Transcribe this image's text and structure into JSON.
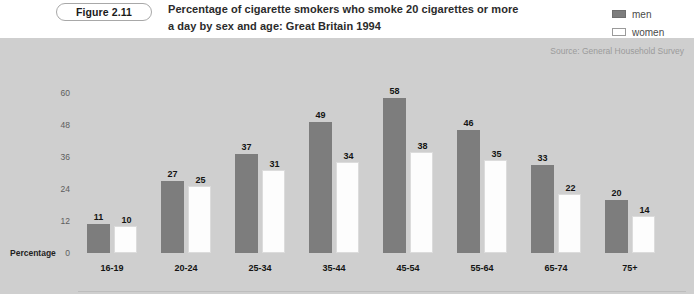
{
  "figure": {
    "badge_label": "Figure 2.11",
    "title_line_1": "Percentage of cigarette smokers who smoke 20 cigarettes or more",
    "title_line_2": "a day by sex and age: Great Britain 1994",
    "source": "Source: General Household Survey"
  },
  "legend": {
    "position": "top-right",
    "entries": [
      {
        "label": "men",
        "color": "#7d7d7d"
      },
      {
        "label": "women",
        "color": "#ffffff"
      }
    ]
  },
  "colors": {
    "panel_background": "#cfcfcf",
    "men_bar": "#7d7d7d",
    "women_bar": "#fdfdfd",
    "women_bar_border": "#dcdcdc",
    "page_background": "#ffffff",
    "source_text": "#9b9b9b"
  },
  "chart_data": {
    "type": "bar",
    "title": "Percentage of cigarette smokers who smoke 20 cigarettes or more a day by sex and age: Great Britain 1994",
    "subtitle": "",
    "xlabel": "Age",
    "ylabel": "Percentage",
    "categories": [
      "16-19",
      "20-24",
      "25-34",
      "35-44",
      "45-54",
      "55-64",
      "65-74",
      "75+"
    ],
    "series": [
      {
        "name": "men",
        "values": [
          11,
          27,
          37,
          49,
          58,
          46,
          33,
          20
        ]
      },
      {
        "name": "women",
        "values": [
          10,
          25,
          31,
          34,
          38,
          35,
          22,
          14
        ]
      }
    ],
    "yticks": [
      0,
      12,
      24,
      36,
      48,
      60
    ],
    "ylim": [
      0,
      60
    ],
    "grid": false,
    "legend_position": "top-right",
    "data_labels": true,
    "annotations": [
      "Source: General Household Survey"
    ]
  }
}
